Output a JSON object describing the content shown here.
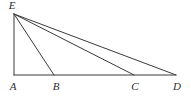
{
  "figure": {
    "background_color": "#ffffff",
    "stroke_color": "#3a3a3a",
    "label_color": "#2e2e2e",
    "width": 191,
    "height": 97,
    "points": [
      {
        "id": "E",
        "label": "E",
        "x": 14,
        "y": 14,
        "label_x": 12,
        "label_y": 6
      },
      {
        "id": "A",
        "label": "A",
        "x": 14,
        "y": 75,
        "label_x": 13,
        "label_y": 87
      },
      {
        "id": "B",
        "label": "B",
        "x": 54,
        "y": 75,
        "label_x": 56,
        "label_y": 87
      },
      {
        "id": "C",
        "label": "C",
        "x": 134,
        "y": 75,
        "label_x": 135,
        "label_y": 87
      },
      {
        "id": "D",
        "label": "D",
        "x": 176,
        "y": 75,
        "label_x": 177,
        "label_y": 87
      }
    ],
    "segments": [
      {
        "id": "EA",
        "from": "E",
        "to": "A",
        "x1": 14,
        "y1": 14,
        "x2": 14,
        "y2": 75
      },
      {
        "id": "AD",
        "from": "A",
        "to": "D",
        "x1": 14,
        "y1": 75,
        "x2": 176,
        "y2": 75
      },
      {
        "id": "EB",
        "from": "E",
        "to": "B",
        "x1": 14,
        "y1": 14,
        "x2": 54,
        "y2": 75
      },
      {
        "id": "EC",
        "from": "E",
        "to": "C",
        "x1": 14,
        "y1": 14,
        "x2": 134,
        "y2": 75
      },
      {
        "id": "ED",
        "from": "E",
        "to": "D",
        "x1": 14,
        "y1": 14,
        "x2": 176,
        "y2": 75
      }
    ]
  }
}
